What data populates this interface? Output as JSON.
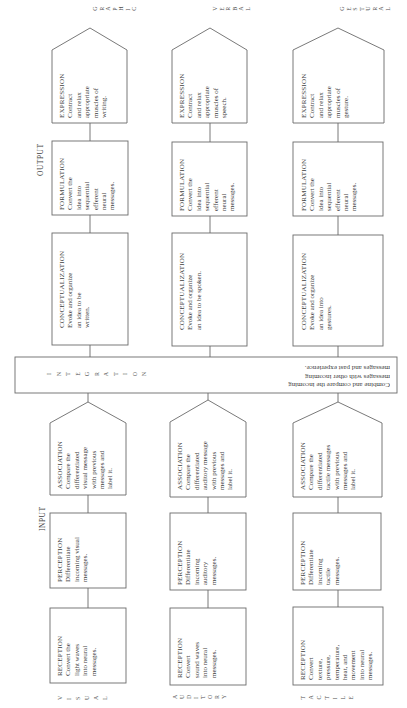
{
  "diagram": {
    "section_labels": {
      "output": "OUTPUT",
      "input": "INPUT"
    },
    "integration": {
      "letters": [
        "I",
        "N",
        "T",
        "E",
        "G",
        "R",
        "A",
        "T",
        "I",
        "O",
        "N"
      ],
      "title": "INTEGRATION",
      "description": "Combine and compare the incoming\nmessages with other incoming\nmessages and past experience."
    },
    "channels": [
      {
        "id": "visual-graphic",
        "input_label_letters": [
          "V",
          "I",
          "S",
          "U",
          "A",
          "L"
        ],
        "output_label_letters": [
          "G",
          "R",
          "A",
          "P",
          "H",
          "I",
          "C"
        ],
        "reception": {
          "title": "RECEPTION",
          "text": "Convert the\nlight waves\ninto neural\nmessages."
        },
        "perception": {
          "title": "PERCEPTION",
          "text": "Differentiate\nincoming visual\nmessages."
        },
        "association": {
          "title": "ASSOCIATION",
          "text": "Compare the\ndifferentiated\nvisual message\nwith previous\nmessages and\nlabel it."
        },
        "conceptualization": {
          "title": "CONCEPTUALIZATION",
          "text": "Evoke and organize\nan idea to be\nwritten."
        },
        "formulation": {
          "title": "FORMULATION",
          "text": "Convert the\nidea into\nsequential\nefferent\nneural\nmessages."
        },
        "expression": {
          "title": "EXPRESSION",
          "text": "Contract\nand relax\nappropriate\nmuscles of\nwriting."
        }
      },
      {
        "id": "auditory-verbal",
        "input_label_letters": [
          "A",
          "U",
          "D",
          "I",
          "T",
          "O",
          "R",
          "Y"
        ],
        "output_label_letters": [
          "V",
          "E",
          "R",
          "B",
          "A",
          "L"
        ],
        "reception": {
          "title": "RECEPTION",
          "text": "Convert\nsound waves\ninto neural\nmessages."
        },
        "perception": {
          "title": "PERCEPTION",
          "text": "Differentiate\nincoming\nauditory\nmessages."
        },
        "association": {
          "title": "ASSOCIATION",
          "text": "Compare the\ndifferentiated\nauditory message\nwith previous\nmessages and\nlabel it."
        },
        "conceptualization": {
          "title": "CONCEPTUALIZATION",
          "text": "Evoke and organize\nan idea to be spoken."
        },
        "formulation": {
          "title": "FORMULATION",
          "text": "Convert the\nidea into\nsequential\nefferent\nneural\nmessages."
        },
        "expression": {
          "title": "EXPRESSION",
          "text": "Contract\nand relax\nappropriate\nmuscles of\nspeech."
        }
      },
      {
        "id": "tactile-gestural",
        "input_label_letters": [
          "T",
          "A",
          "C",
          "T",
          "I",
          "L",
          "E"
        ],
        "output_label_letters": [
          "G",
          "E",
          "S",
          "T",
          "U",
          "R",
          "A",
          "L"
        ],
        "reception": {
          "title": "RECEPTION",
          "text": "Convert\ntexture,\npressure,\ntemperature,\nheat, and\nmovement\ninto neural\nmessages."
        },
        "perception": {
          "title": "PERCEPTION",
          "text": "Differentiate\nincoming\ntactile\nmessages."
        },
        "association": {
          "title": "ASSOCIATION",
          "text": "Compare the\ndifferentiated\ntactile messages\nwith previous\nmessages and\nlabel it."
        },
        "conceptualization": {
          "title": "CONCEPTUALIZATION",
          "text": "Evoke and organize\nan idea into\ngestures."
        },
        "formulation": {
          "title": "FORMULATION",
          "text": "Convert the\nidea into\nsequential\nefferent\nneural\nmessages."
        },
        "expression": {
          "title": "EXPRESSION",
          "text": "Contract\nand relax\nappropriate\nmuscles of\ngesture."
        }
      }
    ]
  }
}
